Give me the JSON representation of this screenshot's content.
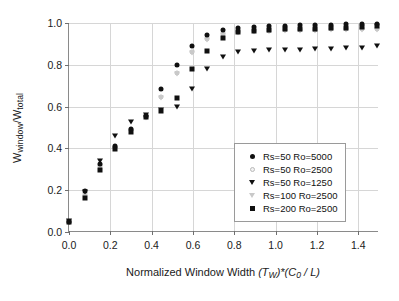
{
  "chart_data": {
    "type": "scatter",
    "title": "",
    "xlabel": "Normalized Window Width (TW)*(C0 / L)",
    "ylabel": "Wwindow/Wtotal",
    "xlim": [
      0.0,
      1.5
    ],
    "ylim": [
      0.0,
      1.0
    ],
    "grid": true,
    "legend_position": "lower-right-inside",
    "xticks": [
      "0.0",
      "0.2",
      "0.4",
      "0.6",
      "0.8",
      "1.0",
      "1.2",
      "1.4"
    ],
    "xtick_values": [
      0.0,
      0.2,
      0.4,
      0.6,
      0.8,
      1.0,
      1.2,
      1.4
    ],
    "yticks": [
      "0.0",
      "0.2",
      "0.4",
      "0.6",
      "0.8",
      "1.0"
    ],
    "ytick_values": [
      0.0,
      0.2,
      0.4,
      0.6,
      0.8,
      1.0
    ],
    "x": [
      0.0,
      0.075,
      0.15,
      0.223,
      0.298,
      0.372,
      0.446,
      0.521,
      0.596,
      0.67,
      0.745,
      0.82,
      0.894,
      0.968,
      1.043,
      1.118,
      1.192,
      1.266,
      1.341,
      1.416,
      1.49
    ],
    "series": [
      {
        "name": "Rs=50 Ro=5000",
        "marker": "filled-circle",
        "color": "#101010",
        "values": [
          0.05,
          0.195,
          0.325,
          0.41,
          0.495,
          0.555,
          0.685,
          0.8,
          0.888,
          0.942,
          0.968,
          0.978,
          0.983,
          0.985,
          0.987,
          0.989,
          0.99,
          0.992,
          0.993,
          0.995,
          0.997
        ]
      },
      {
        "name": "Rs=50 Ro=2500",
        "marker": "open-circle",
        "color": "#c9c9c9",
        "values": [
          0.05,
          0.178,
          0.315,
          0.402,
          0.487,
          0.548,
          0.645,
          0.762,
          0.862,
          0.922,
          0.948,
          0.958,
          0.962,
          0.964,
          0.966,
          0.967,
          0.968,
          0.969,
          0.97,
          0.971,
          0.972
        ]
      },
      {
        "name": "Rs=50 Ro=1250",
        "marker": "filled-triangle-down",
        "color": "#101010",
        "values": [
          0.055,
          0.192,
          0.338,
          0.458,
          0.528,
          0.562,
          0.585,
          0.596,
          0.682,
          0.778,
          0.836,
          0.862,
          0.868,
          0.87,
          0.872,
          0.873,
          0.875,
          0.877,
          0.879,
          0.882,
          0.889
        ]
      },
      {
        "name": "Rs=100 Ro=2500",
        "marker": "open-triangle-down",
        "color": "#c9c9c9",
        "values": [
          0.05,
          0.175,
          0.312,
          0.398,
          0.482,
          0.545,
          0.642,
          0.758,
          0.858,
          0.918,
          0.944,
          0.954,
          0.958,
          0.96,
          0.962,
          0.963,
          0.964,
          0.965,
          0.966,
          0.967,
          0.968
        ]
      },
      {
        "name": "Rs=200 Ro=2500",
        "marker": "filled-square",
        "color": "#101010",
        "values": [
          0.05,
          0.162,
          0.298,
          0.395,
          0.478,
          0.552,
          0.578,
          0.64,
          0.778,
          0.868,
          0.93,
          0.955,
          0.963,
          0.966,
          0.969,
          0.971,
          0.973,
          0.975,
          0.977,
          0.98,
          0.985
        ]
      }
    ]
  },
  "axis_titles": {
    "x_main": "Normalized Window Width ",
    "x_italic_1": "(T",
    "x_sub_1": "W",
    "x_italic_2": ")*(C",
    "x_sub_2": "0",
    "x_italic_3": " / L)",
    "y_main_1": "W",
    "y_sub_1": "window",
    "y_main_2": "/W",
    "y_sub_2": "total"
  },
  "legend": {
    "entries": [
      {
        "label": "Rs=50 Ro=5000",
        "marker": "filled-circle"
      },
      {
        "label": "Rs=50 Ro=2500",
        "marker": "open-circle"
      },
      {
        "label": "Rs=50 Ro=1250",
        "marker": "filled-triangle-down"
      },
      {
        "label": "Rs=100 Ro=2500",
        "marker": "open-triangle-down"
      },
      {
        "label": "Rs=200 Ro=2500",
        "marker": "filled-square"
      }
    ]
  },
  "colors": {
    "marker_filled": "#101010",
    "marker_open": "#c9c9c9",
    "gridline": "#d6d6d6",
    "axis": "#8a8a8a",
    "background": "#ffffff"
  }
}
